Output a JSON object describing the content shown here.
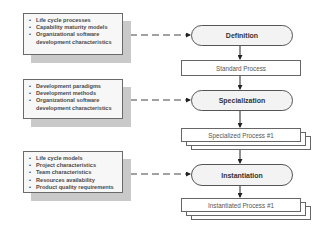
{
  "diagram": {
    "inputs": [
      {
        "id": "definition-inputs",
        "items": [
          "Life cycle processes",
          "Capability maturity models",
          "Organizational software",
          "development characteristics"
        ]
      },
      {
        "id": "specialization-inputs",
        "items": [
          "Development paradigms",
          "Development methods",
          "Organizational software",
          "development characteristics"
        ]
      },
      {
        "id": "instantiation-inputs",
        "items": [
          "Life cycle models",
          "Project characteristics",
          "Team characteristics",
          "Resources availability",
          "Product quality requirements"
        ]
      }
    ],
    "stages": [
      {
        "label": "Definition",
        "output": "Standard Process"
      },
      {
        "label": "Specialization",
        "output": "Specialized Process #1"
      },
      {
        "label": "Instantiation",
        "output": "Instantiated Process #1"
      }
    ],
    "colors": {
      "stage_fill": "#f3f3f3",
      "input_fill": "#f7f7f7",
      "shadow": "#c9c9c9",
      "stroke": "#555555"
    }
  }
}
